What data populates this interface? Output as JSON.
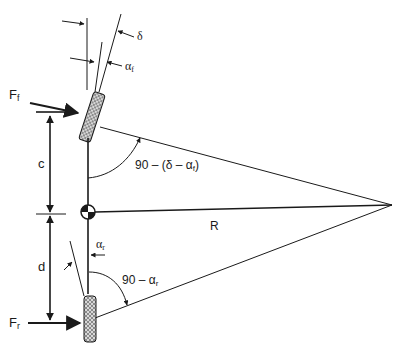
{
  "diagram": {
    "labels": {
      "delta": "δ",
      "alpha_f_top": "α",
      "alpha_f_top_sub": "f",
      "Ff": "F",
      "Ff_sub": "f",
      "Fr": "F",
      "Fr_sub": "r",
      "c": "c",
      "d": "d",
      "R": "R",
      "front_angle": "90 – (δ – α",
      "front_angle_sub": "f",
      "front_angle_close": ")",
      "alpha_r": "α",
      "alpha_r_sub": "r",
      "rear_angle": "90 – α",
      "rear_angle_sub": "r"
    },
    "colors": {
      "line": "#1a1a1a",
      "background": "#ffffff",
      "tire_fill": "#cfcfcf"
    }
  }
}
